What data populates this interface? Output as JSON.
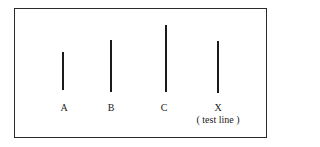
{
  "diagram": {
    "lines": [
      {
        "id": "A",
        "label": "A",
        "x": 63,
        "top": 52,
        "bottom": 90
      },
      {
        "id": "B",
        "label": "B",
        "x": 111,
        "top": 40,
        "bottom": 92
      },
      {
        "id": "C",
        "label": "C",
        "x": 166,
        "top": 25,
        "bottom": 92
      },
      {
        "id": "X",
        "label": "X",
        "sublabel": "( test line )",
        "x": 218,
        "top": 41,
        "bottom": 93
      }
    ]
  }
}
